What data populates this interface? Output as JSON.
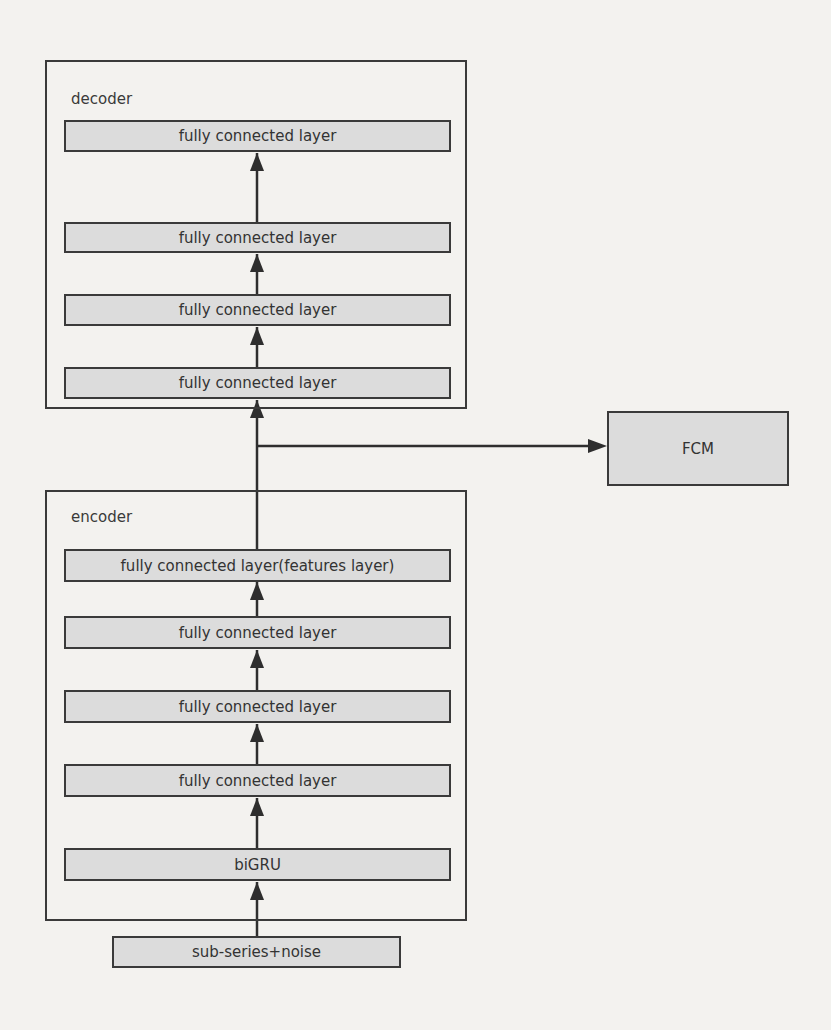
{
  "diagram": {
    "decoder": {
      "label": "decoder",
      "layers": [
        "fully connected layer",
        "fully connected layer",
        "fully connected layer",
        "fully connected layer"
      ]
    },
    "encoder": {
      "label": "encoder",
      "layers": [
        "fully connected layer(features layer)",
        "fully connected layer",
        "fully connected layer",
        "fully connected layer",
        "biGRU"
      ]
    },
    "input": {
      "label": "sub-series+noise"
    },
    "fcm": {
      "label": "FCM"
    }
  }
}
